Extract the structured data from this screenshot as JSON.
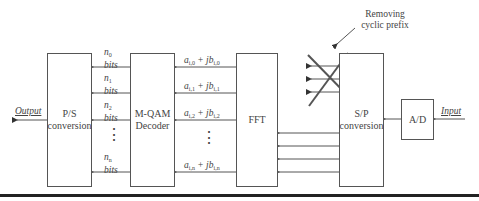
{
  "blocks": {
    "ps": {
      "line1": "P/S",
      "line2": "conversion"
    },
    "qam": {
      "line1": "M-QAM",
      "line2": "Decoder"
    },
    "fft": {
      "label": "FFT"
    },
    "sp": {
      "line1": "S/P",
      "line2": "conversion"
    },
    "ad": {
      "label": "A/D"
    }
  },
  "labels": {
    "output": "Output",
    "input": "Input",
    "annotation_line1": "Removing",
    "annotation_line2": "cyclic prefix"
  },
  "bits": [
    {
      "n": "n",
      "sub": "0",
      "text": "bits"
    },
    {
      "n": "n",
      "sub": "1",
      "text": "bits"
    },
    {
      "n": "n",
      "sub": "2",
      "text": "bits"
    },
    {
      "n": "n",
      "sub": "n",
      "text": "bits"
    }
  ],
  "symbols": [
    {
      "a": "a",
      "asub": "i,0",
      "plus": " + jb",
      "bsub": "i,0"
    },
    {
      "a": "a",
      "asub": "i,1",
      "plus": " + jb",
      "bsub": "i,1"
    },
    {
      "a": "a",
      "asub": "i,2",
      "plus": " + jb",
      "bsub": "i,2"
    },
    {
      "a": "a",
      "asub": "i,n",
      "plus": " + jb",
      "bsub": "i,n"
    }
  ],
  "ellipsis": "⋮"
}
